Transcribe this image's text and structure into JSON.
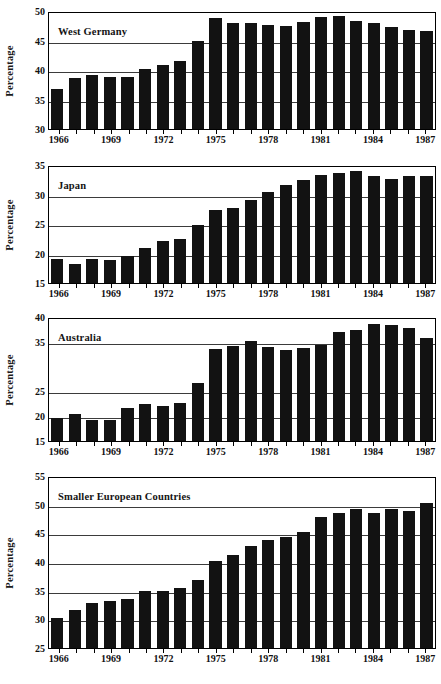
{
  "figure": {
    "ylabel": "Percentage",
    "xtick_years": [
      1966,
      1969,
      1972,
      1975,
      1978,
      1981,
      1984,
      1987
    ],
    "colors": {
      "bar": "#121212",
      "axis": "#000000",
      "grid": "#3b3b3b",
      "background": "#ffffff"
    }
  },
  "chart_data": [
    {
      "type": "bar",
      "title": "West Germany",
      "xlabel": "",
      "ylabel": "Percentage",
      "ylim": [
        30,
        50
      ],
      "yticks": [
        30,
        35,
        40,
        45,
        50
      ],
      "grid": true,
      "legend": "none",
      "categories": [
        1966,
        1967,
        1968,
        1969,
        1970,
        1971,
        1972,
        1973,
        1974,
        1975,
        1976,
        1977,
        1978,
        1979,
        1980,
        1981,
        1982,
        1983,
        1984,
        1985,
        1986,
        1987
      ],
      "values": [
        36.7,
        38.6,
        39.2,
        38.8,
        38.8,
        40.2,
        40.9,
        41.6,
        44.9,
        48.8,
        47.9,
        47.9,
        47.6,
        47.5,
        48.2,
        49.0,
        49.2,
        48.3,
        47.9,
        47.3,
        46.8,
        46.6
      ]
    },
    {
      "type": "bar",
      "title": "Japan",
      "xlabel": "",
      "ylabel": "Percentage",
      "ylim": [
        15,
        35
      ],
      "yticks": [
        15,
        20,
        25,
        30,
        35
      ],
      "grid": true,
      "legend": "none",
      "categories": [
        1966,
        1967,
        1968,
        1969,
        1970,
        1971,
        1972,
        1973,
        1974,
        1975,
        1976,
        1977,
        1978,
        1979,
        1980,
        1981,
        1982,
        1983,
        1984,
        1985,
        1986,
        1987
      ],
      "values": [
        19.1,
        18.2,
        19.1,
        18.9,
        19.5,
        21.0,
        22.2,
        22.5,
        24.8,
        27.3,
        27.7,
        29.0,
        30.4,
        31.6,
        32.5,
        33.3,
        33.6,
        34.0,
        33.2,
        32.7,
        33.1,
        33.1
      ]
    },
    {
      "type": "bar",
      "title": "Australia",
      "xlabel": "",
      "ylabel": "Percentage",
      "ylim": [
        15,
        40
      ],
      "yticks": [
        15,
        20,
        25,
        35,
        40
      ],
      "grid": true,
      "legend": "none",
      "categories": [
        1966,
        1967,
        1968,
        1969,
        1970,
        1971,
        1972,
        1973,
        1974,
        1975,
        1976,
        1977,
        1978,
        1979,
        1980,
        1981,
        1982,
        1983,
        1984,
        1985,
        1986,
        1987
      ],
      "values": [
        19.7,
        20.4,
        19.2,
        19.2,
        21.7,
        22.4,
        22.1,
        22.7,
        26.6,
        33.5,
        34.1,
        35.1,
        34.0,
        33.3,
        33.7,
        34.4,
        37.0,
        37.4,
        38.5,
        38.4,
        37.8,
        35.7
      ]
    },
    {
      "type": "bar",
      "title": "Smaller European Countries",
      "xlabel": "",
      "ylabel": "Percentage",
      "ylim": [
        25,
        55
      ],
      "yticks": [
        25,
        30,
        35,
        40,
        45,
        50,
        55
      ],
      "grid": true,
      "legend": "none",
      "categories": [
        1966,
        1967,
        1968,
        1969,
        1970,
        1971,
        1972,
        1973,
        1974,
        1975,
        1976,
        1977,
        1978,
        1979,
        1980,
        1981,
        1982,
        1983,
        1984,
        1985,
        1986,
        1987
      ],
      "values": [
        30.2,
        31.7,
        32.8,
        33.2,
        33.6,
        35.0,
        35.0,
        35.4,
        36.8,
        40.1,
        41.3,
        42.8,
        43.8,
        44.4,
        45.2,
        47.8,
        48.6,
        49.3,
        48.5,
        49.2,
        48.9,
        50.3
      ]
    }
  ]
}
